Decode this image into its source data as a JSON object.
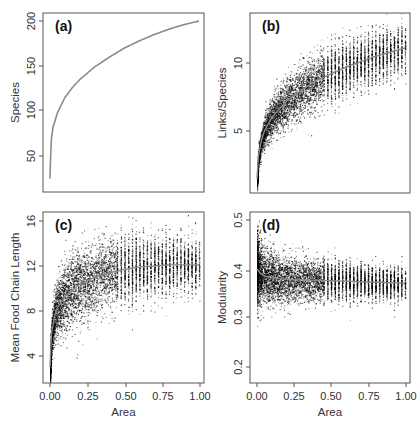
{
  "figure": {
    "width": 420,
    "height": 422,
    "colors": {
      "axis": "#555555",
      "points": "#000000",
      "curve": "#8a8a8a",
      "text": "#333333",
      "panel_label": "#111111"
    }
  },
  "chart_data": [
    {
      "id": "a",
      "panel_label": "(a)",
      "type": "line",
      "title": "",
      "xlabel": "",
      "ylabel": "Species",
      "xlim": [
        0,
        1
      ],
      "ylim": [
        10,
        210
      ],
      "xticks": [],
      "xtick_labels": [],
      "yticks": [
        50,
        100,
        150,
        200
      ],
      "ytick_labels": [
        "50",
        "100",
        "150",
        "200"
      ],
      "grid": false,
      "box": {
        "x0": 43,
        "y0": 13,
        "x1": 204,
        "y1": 192
      },
      "tick_pixels": {
        "y": [
          156,
          110,
          66,
          21
        ]
      },
      "series": [
        {
          "name": "Species-area curve",
          "x": [
            0.0,
            0.005,
            0.01,
            0.02,
            0.05,
            0.1,
            0.15,
            0.2,
            0.3,
            0.4,
            0.5,
            0.6,
            0.7,
            0.8,
            0.9,
            1.0
          ],
          "y": [
            25,
            55,
            70,
            82,
            98,
            115,
            126,
            135,
            149,
            160,
            170,
            178,
            185,
            191,
            196,
            200
          ]
        }
      ]
    },
    {
      "id": "b",
      "panel_label": "(b)",
      "type": "scatter",
      "title": "",
      "xlabel": "",
      "ylabel": "Links/Species",
      "xlim": [
        0,
        1
      ],
      "ylim": [
        1,
        13
      ],
      "xticks": [],
      "xtick_labels": [],
      "yticks": [
        5,
        10
      ],
      "ytick_labels": [
        "5",
        "10"
      ],
      "grid": false,
      "box": {
        "x0": 250,
        "y0": 13,
        "x1": 410,
        "y1": 193
      },
      "tick_pixels": {
        "y": [
          131,
          63
        ]
      },
      "fit_curve": {
        "x": [
          0.0,
          0.01,
          0.03,
          0.05,
          0.1,
          0.2,
          0.3,
          0.4,
          0.5,
          0.6,
          0.7,
          0.8,
          0.9,
          1.0
        ],
        "y": [
          1.5,
          3.2,
          4.3,
          5.0,
          6.0,
          7.2,
          8.0,
          8.7,
          9.2,
          9.7,
          10.1,
          10.5,
          10.8,
          11.1
        ]
      },
      "scatter_spread": {
        "x": [
          0.0,
          0.1,
          0.5,
          1.0
        ],
        "sd": [
          0.3,
          0.8,
          1.0,
          0.9
        ]
      },
      "n_points": 6000
    },
    {
      "id": "c",
      "panel_label": "(c)",
      "type": "scatter",
      "title": "",
      "xlabel": "Area",
      "ylabel": "Mean Food Chain Length",
      "xlim": [
        0,
        1
      ],
      "ylim": [
        2,
        17
      ],
      "xticks": [
        0,
        0.25,
        0.5,
        0.75,
        1.0
      ],
      "xtick_labels": [
        "0.00",
        "0.25",
        "0.50",
        "0.75",
        "1.00"
      ],
      "yticks": [
        4,
        8,
        12,
        16
      ],
      "ytick_labels": [
        "4",
        "8",
        "12",
        "16"
      ],
      "grid": false,
      "box": {
        "x0": 43,
        "y0": 212,
        "x1": 204,
        "y1": 383
      },
      "tick_pixels": {
        "x": [
          50,
          88,
          126,
          163,
          200
        ],
        "y": [
          356,
          311,
          266,
          221
        ]
      },
      "fit_curve": {
        "x": [
          0.0,
          0.01,
          0.03,
          0.05,
          0.1,
          0.2,
          0.3,
          0.4,
          0.5,
          0.6,
          0.7,
          0.8,
          0.9,
          1.0
        ],
        "y": [
          3.0,
          6.0,
          7.5,
          8.3,
          9.3,
          10.4,
          11.0,
          11.4,
          11.7,
          11.9,
          12.0,
          12.1,
          12.1,
          12.1
        ]
      },
      "scatter_spread": {
        "x": [
          0.0,
          0.1,
          0.5,
          1.0
        ],
        "sd": [
          0.8,
          1.6,
          1.5,
          1.1
        ]
      },
      "n_points": 6000
    },
    {
      "id": "d",
      "panel_label": "(d)",
      "type": "scatter",
      "title": "",
      "xlabel": "Area",
      "ylabel": "Modularity",
      "xlim": [
        0,
        1
      ],
      "ylim": [
        0.19,
        0.51
      ],
      "xticks": [
        0,
        0.25,
        0.5,
        0.75,
        1.0
      ],
      "xtick_labels": [
        "0.00",
        "0.25",
        "0.50",
        "0.75",
        "1.00"
      ],
      "yticks": [
        0.2,
        0.3,
        0.4,
        0.5
      ],
      "ytick_labels": [
        "0.2",
        "0.3",
        "0.4",
        "0.5"
      ],
      "grid": false,
      "box": {
        "x0": 250,
        "y0": 212,
        "x1": 410,
        "y1": 383
      },
      "tick_pixels": {
        "x": [
          257,
          294,
          331,
          369,
          406
        ],
        "y": [
          367,
          317,
          271,
          220
        ]
      },
      "fit_curve": {
        "x": [
          0.0,
          0.02,
          0.05,
          0.1,
          0.2,
          0.3,
          0.4,
          0.5,
          0.6,
          0.7,
          0.8,
          0.9,
          1.0
        ],
        "y": [
          0.4,
          0.392,
          0.386,
          0.382,
          0.379,
          0.378,
          0.377,
          0.376,
          0.375,
          0.374,
          0.373,
          0.372,
          0.371
        ]
      },
      "scatter_spread": {
        "x": [
          0.0,
          0.05,
          0.3,
          1.0
        ],
        "sd": [
          0.035,
          0.028,
          0.022,
          0.016
        ]
      },
      "n_points": 6000
    }
  ]
}
